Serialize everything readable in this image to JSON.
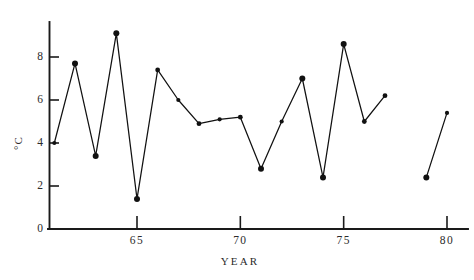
{
  "chart_data": {
    "type": "line",
    "title": "",
    "xlabel": "YEAR",
    "ylabel": "°C",
    "xlim": [
      60.2,
      81.0
    ],
    "ylim": [
      0,
      9.9
    ],
    "xticks": [
      65,
      70,
      75,
      80
    ],
    "xtick_labels": [
      "65",
      "70",
      "75",
      "80"
    ],
    "yticks": [
      0,
      2,
      4,
      6,
      8
    ],
    "ytick_labels": [
      "0",
      "2",
      "4",
      "6",
      "8"
    ],
    "grid": false,
    "legend": "none",
    "marker": "filled-circle",
    "line_color": "#111111",
    "marker_color": "#111111",
    "axis_color": "#1a1a1a",
    "x": [
      61,
      62,
      63,
      64,
      65,
      66,
      67,
      68,
      69,
      70,
      71,
      72,
      73,
      74,
      75,
      76,
      77,
      79,
      80
    ],
    "values": [
      4.0,
      7.7,
      3.4,
      9.1,
      1.4,
      7.4,
      6.0,
      4.9,
      5.1,
      5.2,
      2.8,
      5.0,
      7.0,
      2.4,
      8.6,
      5.0,
      6.2,
      2.4,
      5.4
    ],
    "series": [
      {
        "name": "temperature",
        "segments": [
          {
            "x": [
              61,
              62,
              63,
              64,
              65,
              66,
              67,
              68,
              69,
              70,
              71,
              72,
              73,
              74,
              75,
              76,
              77
            ],
            "values": [
              4.0,
              7.7,
              3.4,
              9.1,
              1.4,
              7.4,
              6.0,
              4.9,
              5.1,
              5.2,
              2.8,
              5.0,
              7.0,
              2.4,
              8.6,
              5.0,
              6.2
            ]
          },
          {
            "x": [
              79,
              80
            ],
            "values": [
              2.4,
              5.4
            ]
          }
        ]
      }
    ]
  }
}
